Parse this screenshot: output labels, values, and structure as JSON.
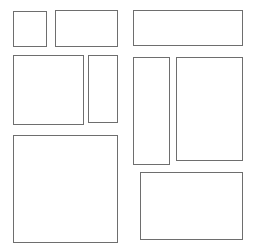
{
  "diagram": {
    "type": "wireframe-boxes",
    "canvas": {
      "width": 256,
      "height": 252,
      "background_color": "#ffffff"
    },
    "style": {
      "border_color": "#6e6e6e",
      "border_width": 1,
      "fill_color": "#ffffff"
    },
    "boxes": [
      {
        "id": "box-1",
        "name": "top-left-small-box",
        "x": 13,
        "y": 11,
        "width": 34,
        "height": 36,
        "label": ""
      },
      {
        "id": "box-2",
        "name": "top-middle-wide-box",
        "x": 55,
        "y": 10,
        "width": 63,
        "height": 37,
        "label": ""
      },
      {
        "id": "box-3",
        "name": "top-right-wide-box",
        "x": 133,
        "y": 10,
        "width": 110,
        "height": 36,
        "label": ""
      },
      {
        "id": "box-4",
        "name": "mid-left-square-box",
        "x": 13,
        "y": 55,
        "width": 71,
        "height": 70,
        "label": ""
      },
      {
        "id": "box-5",
        "name": "mid-narrow-tall-box",
        "x": 88,
        "y": 55,
        "width": 30,
        "height": 68,
        "label": ""
      },
      {
        "id": "box-6",
        "name": "mid-right-tall-box",
        "x": 133,
        "y": 57,
        "width": 37,
        "height": 108,
        "label": ""
      },
      {
        "id": "box-7",
        "name": "far-right-tall-box",
        "x": 176,
        "y": 57,
        "width": 67,
        "height": 104,
        "label": ""
      },
      {
        "id": "box-8",
        "name": "bottom-left-large-box",
        "x": 13,
        "y": 135,
        "width": 105,
        "height": 108,
        "label": ""
      },
      {
        "id": "box-9",
        "name": "bottom-right-wide-box",
        "x": 140,
        "y": 172,
        "width": 103,
        "height": 68,
        "label": ""
      }
    ]
  }
}
